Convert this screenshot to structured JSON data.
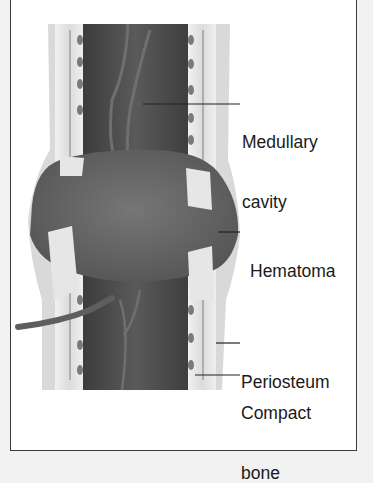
{
  "figure": {
    "labels": [
      {
        "id": "medullary",
        "line1": "Medullary",
        "line2": "cavity"
      },
      {
        "id": "hematoma",
        "line1": "Hematoma"
      },
      {
        "id": "periosteum",
        "line1": "Periosteum"
      },
      {
        "id": "compact",
        "line1": "Compact",
        "line2": "bone"
      }
    ]
  },
  "colors": {
    "background": "#ffffff",
    "outer": "#f2f2f2",
    "frame": "#3a3a3a",
    "medulla": "#4b4b4b",
    "hematoma": "#6b6b6b",
    "compact_bone": "#e4e4e4",
    "periosteum": "#d6d6d6",
    "vessel": "#5e5e5e",
    "text": "#1a1a1a"
  }
}
